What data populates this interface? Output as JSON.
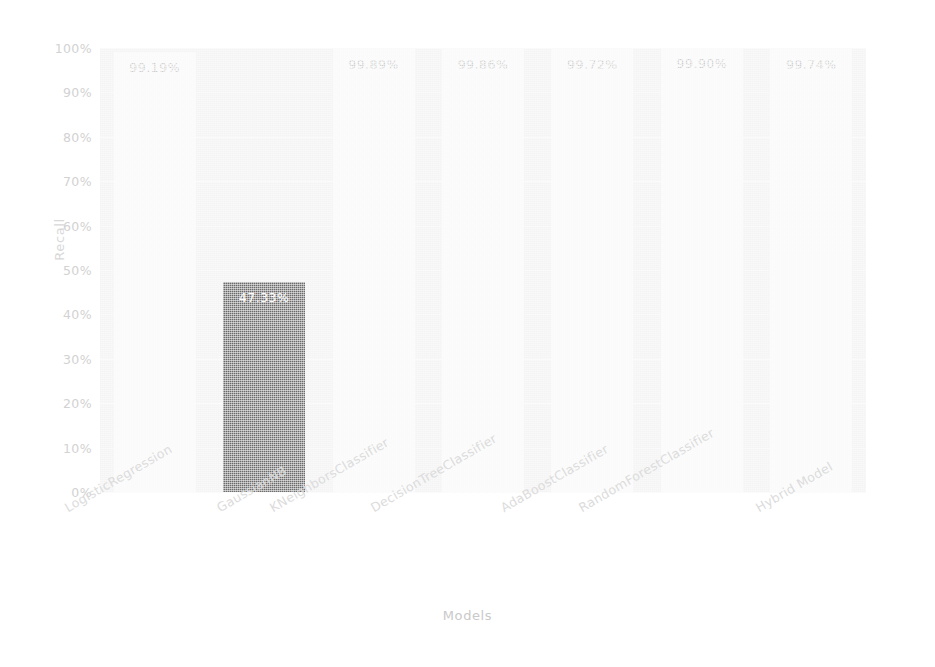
{
  "chart_data": {
    "type": "bar",
    "title": "",
    "xlabel": "Models",
    "ylabel": "Recall",
    "categories": [
      "LogisticRegression",
      "GaussianNB",
      "KNeighborsClassifier",
      "DecisionTreeClassifier",
      "AdaBoostClassifier",
      "RandomForestClassifier",
      "Hybrid Model"
    ],
    "values": [
      99.19,
      47.33,
      99.89,
      99.86,
      99.72,
      99.9,
      99.74
    ],
    "value_labels": [
      "99.19%",
      "47.33%",
      "99.89%",
      "99.86%",
      "99.72%",
      "99.90%",
      "99.74%"
    ],
    "bar_colors": [
      "#fcfcfc",
      "#6a6a6a",
      "#fcfcfc",
      "#fcfcfc",
      "#fcfcfc",
      "#fcfcfc",
      "#fcfcfc"
    ],
    "label_colors": [
      "#cfcfcf",
      "#ffffff",
      "#cfcfcf",
      "#cfcfcf",
      "#cfcfcf",
      "#cfcfcf",
      "#cfcfcf"
    ],
    "ylim": [
      0,
      100
    ],
    "yticks": [
      0,
      10,
      20,
      30,
      40,
      50,
      60,
      70,
      80,
      90,
      100
    ],
    "ytick_labels": [
      "0%",
      "10%",
      "20%",
      "30%",
      "40%",
      "50%",
      "60%",
      "70%",
      "80%",
      "90%",
      "100%"
    ],
    "grid": true,
    "legend": false,
    "xtick_rotation": -30,
    "plot_background": "#f4f4f4",
    "figure_background": "#ffffff",
    "tick_label_color": "#d2d2d2",
    "axis_label_color": "#c9c9c9"
  }
}
